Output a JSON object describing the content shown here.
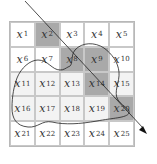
{
  "diagram": {
    "grid": {
      "rows": 5,
      "cols": 5,
      "cells": [
        {
          "var": "x",
          "sub": "1",
          "shade": "none"
        },
        {
          "var": "x",
          "sub": "2",
          "shade": "dark"
        },
        {
          "var": "x",
          "sub": "3",
          "shade": "none"
        },
        {
          "var": "x",
          "sub": "4",
          "shade": "none"
        },
        {
          "var": "x",
          "sub": "5",
          "shade": "none"
        },
        {
          "var": "x",
          "sub": "6",
          "shade": "none"
        },
        {
          "var": "x",
          "sub": "7",
          "shade": "none"
        },
        {
          "var": "x",
          "sub": "8",
          "shade": "dark"
        },
        {
          "var": "x",
          "sub": "9",
          "shade": "dark"
        },
        {
          "var": "x",
          "sub": "10",
          "shade": "none"
        },
        {
          "var": "x",
          "sub": "11",
          "shade": "light"
        },
        {
          "var": "x",
          "sub": "12",
          "shade": "light"
        },
        {
          "var": "x",
          "sub": "13",
          "shade": "light"
        },
        {
          "var": "x",
          "sub": "14",
          "shade": "dark"
        },
        {
          "var": "x",
          "sub": "15",
          "shade": "light"
        },
        {
          "var": "x",
          "sub": "16",
          "shade": "light"
        },
        {
          "var": "x",
          "sub": "17",
          "shade": "light"
        },
        {
          "var": "x",
          "sub": "18",
          "shade": "light"
        },
        {
          "var": "x",
          "sub": "19",
          "shade": "light"
        },
        {
          "var": "x",
          "sub": "20",
          "shade": "dark"
        },
        {
          "var": "x",
          "sub": "21",
          "shade": "none"
        },
        {
          "var": "x",
          "sub": "22",
          "shade": "none"
        },
        {
          "var": "x",
          "sub": "23",
          "shade": "none"
        },
        {
          "var": "x",
          "sub": "24",
          "shade": "none"
        },
        {
          "var": "x",
          "sub": "25",
          "shade": "none"
        }
      ]
    },
    "colors": {
      "dark": "#a9a9a9",
      "light": "#f3f3f3",
      "line": "#222222",
      "grid": "#c8c8c8"
    },
    "arrow": {
      "label": "diagonal-path-arrow",
      "passes_through": [
        "x2",
        "x8",
        "x14",
        "x20"
      ]
    },
    "blob": {
      "label": "closed-region-outline"
    }
  }
}
